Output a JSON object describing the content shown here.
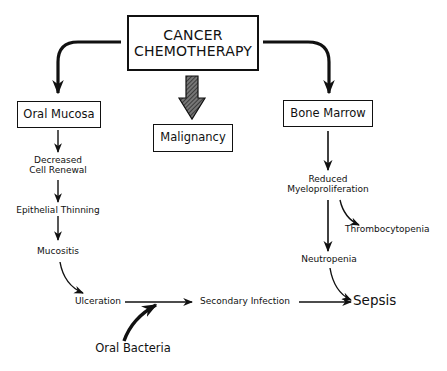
{
  "diagram": {
    "type": "flowchart",
    "root": {
      "id": "chemo",
      "line1": "CANCER",
      "line2": "CHEMOTHERAPY"
    },
    "boxes": {
      "oral_mucosa": "Oral Mucosa",
      "malignancy": "Malignancy",
      "bone_marrow": "Bone Marrow"
    },
    "left_chain": {
      "decreased_line1": "Decreased",
      "decreased_line2": "Cell Renewal",
      "epithelial": "Epithelial Thinning",
      "mucositis": "Mucositis",
      "ulceration": "Ulceration"
    },
    "right_chain": {
      "reduced_line1": "Reduced",
      "reduced_line2": "Myeloproliferation",
      "thrombocytopenia": "Thrombocytopenia",
      "neutropenia": "Neutropenia"
    },
    "bottom": {
      "secondary_infection": "Secondary Infection",
      "sepsis": "Sepsis",
      "oral_bacteria": "Oral Bacteria"
    },
    "edges": [
      {
        "from": "CANCER CHEMOTHERAPY",
        "to": "Oral Mucosa",
        "style": "curved"
      },
      {
        "from": "CANCER CHEMOTHERAPY",
        "to": "Malignancy",
        "style": "hatched-block"
      },
      {
        "from": "CANCER CHEMOTHERAPY",
        "to": "Bone Marrow",
        "style": "curved"
      },
      {
        "from": "Oral Mucosa",
        "to": "Decreased Cell Renewal"
      },
      {
        "from": "Decreased Cell Renewal",
        "to": "Epithelial Thinning"
      },
      {
        "from": "Epithelial Thinning",
        "to": "Mucositis"
      },
      {
        "from": "Mucositis",
        "to": "Ulceration",
        "style": "curved"
      },
      {
        "from": "Ulceration",
        "to": "Secondary Infection"
      },
      {
        "from": "Oral Bacteria",
        "to": "Ulceration→Secondary Infection",
        "style": "curved-bold"
      },
      {
        "from": "Secondary Infection",
        "to": "Sepsis"
      },
      {
        "from": "Bone Marrow",
        "to": "Reduced Myeloproliferation"
      },
      {
        "from": "Reduced Myeloproliferation",
        "to": "Thrombocytopenia",
        "style": "curved"
      },
      {
        "from": "Reduced Myeloproliferation",
        "to": "Neutropenia"
      },
      {
        "from": "Neutropenia",
        "to": "Sepsis",
        "style": "curved"
      }
    ]
  }
}
